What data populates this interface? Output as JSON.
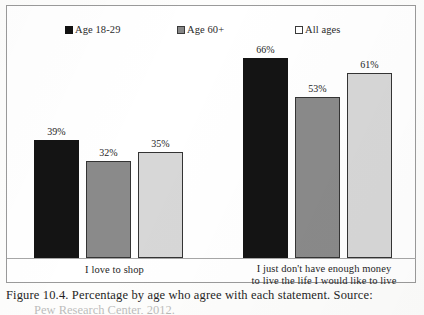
{
  "figure": {
    "caption_line_1": "Figure 10.4. Percentage by age who agree with each statement. Source:",
    "caption_line_2": "Pew Research Center, 2012."
  },
  "legend": {
    "position": "top",
    "entries": [
      {
        "label": "Age 18-29",
        "marker": "filled-square",
        "color": "#141414"
      },
      {
        "label": "Age 60+",
        "marker": "gray-square",
        "color": "#8a8a8a"
      },
      {
        "label": "All ages",
        "marker": "empty-square",
        "color": "#ffffff"
      }
    ]
  },
  "chart_data": {
    "type": "bar",
    "title": "",
    "subtitle": "",
    "xlabel": "",
    "ylabel": "",
    "ylim": [
      0,
      100
    ],
    "grid": false,
    "legend_position": "top",
    "categories": [
      "I love to shop",
      "I just don't have enough money to live the life I would like to live"
    ],
    "category_label_lines": [
      [
        "I love to shop"
      ],
      [
        "I just don't have enough money",
        "to live the life I would like to live"
      ]
    ],
    "series": [
      {
        "name": "Age 18-29",
        "color": "#141414",
        "values": [
          39,
          66
        ],
        "labels": [
          "39%",
          "66%"
        ]
      },
      {
        "name": "Age 60+",
        "color": "#8a8a8a",
        "values": [
          32,
          53
        ],
        "labels": [
          "32%",
          "53%"
        ]
      },
      {
        "name": "All ages",
        "color": "#d7d7d7",
        "values": [
          35,
          61
        ],
        "labels": [
          "35%",
          "61%"
        ]
      }
    ],
    "value_suffix": "%",
    "data_labels_shown": true
  }
}
